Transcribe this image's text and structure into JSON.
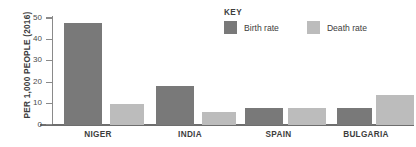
{
  "chart_data": {
    "type": "bar",
    "title": "",
    "subtitle": "",
    "xlabel": "",
    "ylabel": "PER 1,000 PEOPLE (2016)",
    "categories": [
      "NIGER",
      "INDIA",
      "SPAIN",
      "BULGARIA"
    ],
    "series": [
      {
        "name": "Birth rate",
        "color": "#797979",
        "values": [
          47,
          18,
          8,
          8
        ]
      },
      {
        "name": "Death rate",
        "color": "#bcbcbc",
        "values": [
          9.5,
          6,
          7.8,
          14
        ]
      }
    ],
    "ylim": [
      0,
      50
    ],
    "yticks": [
      0,
      10,
      20,
      30,
      40,
      50
    ],
    "ytick_labels": [
      "0",
      "10",
      "20",
      "30",
      "40",
      "50"
    ],
    "grid": false,
    "legend_position": "top-right"
  },
  "legend": {
    "title": "KEY",
    "entries": [
      {
        "label": "Birth rate",
        "color": "#797979"
      },
      {
        "label": "Death rate",
        "color": "#bcbcbc"
      }
    ]
  },
  "axis": {
    "y_title": "PER 1,000 PEOPLE (2016)",
    "tick_0": "0",
    "tick_10": "10",
    "tick_20": "20",
    "tick_30": "30",
    "tick_40": "40",
    "tick_50": "50"
  },
  "groups": {
    "g0": "NIGER",
    "g1": "INDIA",
    "g2": "SPAIN",
    "g3": "BULGARIA"
  }
}
